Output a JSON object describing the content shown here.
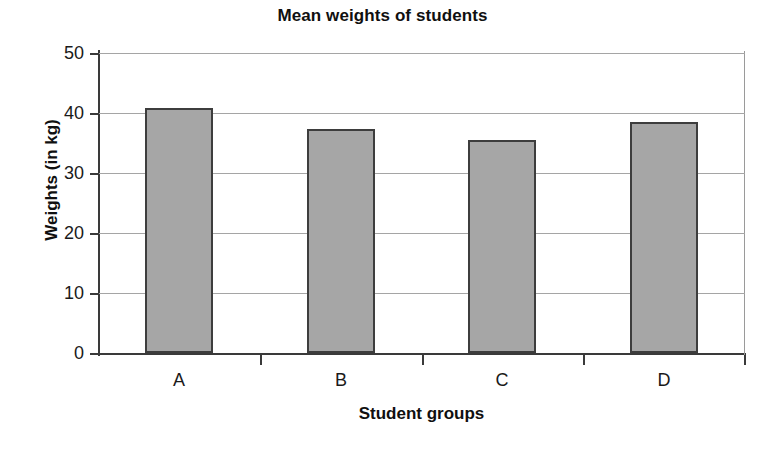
{
  "chart_data": {
    "type": "bar",
    "title": "Mean weights of students",
    "xlabel": "Student groups",
    "ylabel": "Weights (in kg)",
    "categories": [
      "A",
      "B",
      "C",
      "D"
    ],
    "values": [
      40.8,
      37.3,
      35.5,
      38.5
    ],
    "ylim": [
      0,
      50
    ],
    "ytick_labels": [
      "0",
      "10",
      "20",
      "30",
      "40",
      "50"
    ],
    "ytick_values": [
      0,
      10,
      20,
      30,
      40,
      50
    ],
    "grid": "horizontal",
    "legend": "none",
    "bar_fill_color": "#a6a6a6",
    "bar_border_color": "#3d3d3d",
    "gridline_color": "#a5a5a5",
    "axis_color": "#3a3a3a",
    "background_color": "#ffffff"
  }
}
